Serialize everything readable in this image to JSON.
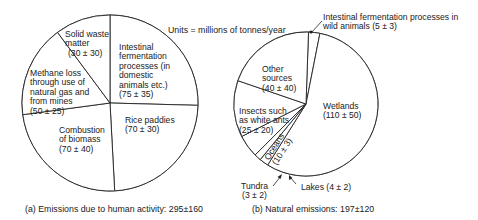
{
  "units_note": "Units = millions of tonnes/year",
  "chart_data": [
    {
      "type": "pie",
      "title": "(a) Emissions due to human activity: 295±160",
      "total": "295±160",
      "slices": [
        {
          "label": [
            "Intestinal",
            "fermentation",
            "processes (in",
            "domestic",
            "animals etc.)",
            "(75 ± 35)"
          ],
          "name": "Intestinal fermentation processes (in domestic animals etc.)",
          "value": 75,
          "uncertainty": 35
        },
        {
          "label": [
            "Rice paddies",
            "(70 ± 30)"
          ],
          "name": "Rice paddies",
          "value": 70,
          "uncertainty": 30
        },
        {
          "label": [
            "Combustion",
            "of biomass",
            "(70 ± 40)"
          ],
          "name": "Combustion of biomass",
          "value": 70,
          "uncertainty": 40
        },
        {
          "label": [
            "Methane loss",
            "through use of",
            "natural gas and",
            "from mines",
            "(50 ± 25)"
          ],
          "name": "Methane loss through use of natural gas and from mines",
          "value": 50,
          "uncertainty": 25
        },
        {
          "label": [
            "Solid waste",
            "matter",
            "(30 ± 30)"
          ],
          "name": "Solid waste matter",
          "value": 30,
          "uncertainty": 30
        }
      ]
    },
    {
      "type": "pie",
      "title": "(b) Natural emissions: 197±120",
      "total": "197±120",
      "slices": [
        {
          "label": [
            "Intestinal fermentation processes in",
            "wild animals (5 ± 3)"
          ],
          "name": "Intestinal fermentation processes in wild animals",
          "value": 5,
          "uncertainty": 3
        },
        {
          "label": [
            "Wetlands",
            "(110 ± 50)"
          ],
          "name": "Wetlands",
          "value": 110,
          "uncertainty": 50
        },
        {
          "label": [
            "Lakes (4 ± 2)"
          ],
          "name": "Lakes",
          "value": 4,
          "uncertainty": 2
        },
        {
          "label": [
            "Tundra",
            "(3 ± 2)"
          ],
          "name": "Tundra",
          "value": 3,
          "uncertainty": 2
        },
        {
          "label": [
            "Oceans",
            "(10 ± 3)"
          ],
          "name": "Oceans",
          "value": 10,
          "uncertainty": 3
        },
        {
          "label": [
            "Insects such",
            "as white ants",
            "(25 ± 20)"
          ],
          "name": "Insects such as white ants",
          "value": 25,
          "uncertainty": 20
        },
        {
          "label": [
            "Other",
            "sources",
            "(40 ± 40)"
          ],
          "name": "Other sources",
          "value": 40,
          "uncertainty": 40
        }
      ]
    }
  ]
}
